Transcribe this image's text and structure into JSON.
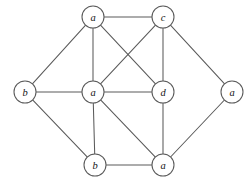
{
  "figure": {
    "kind": "undirected-graph-diagram",
    "width": 252,
    "height": 181,
    "background_color": "#ffffff",
    "stroke_color": "#5a5a5a",
    "label_color": "#141414",
    "node_radius": 11
  },
  "graph": {
    "node_count": 8,
    "edge_count": 15,
    "nodes": [
      {
        "id": "n1",
        "label": "a",
        "x": 93,
        "y": 17,
        "position": "top-left"
      },
      {
        "id": "n2",
        "label": "c",
        "x": 163,
        "y": 17,
        "position": "top-right"
      },
      {
        "id": "n3",
        "label": "b",
        "x": 25,
        "y": 92,
        "position": "middle-far-left"
      },
      {
        "id": "n4",
        "label": "a",
        "x": 93,
        "y": 92,
        "position": "middle-center"
      },
      {
        "id": "n5",
        "label": "d",
        "x": 163,
        "y": 92,
        "position": "middle-right"
      },
      {
        "id": "n6",
        "label": "a",
        "x": 232,
        "y": 92,
        "position": "middle-far-right"
      },
      {
        "id": "n7",
        "label": "b",
        "x": 95,
        "y": 165,
        "position": "bottom-left"
      },
      {
        "id": "n8",
        "label": "a",
        "x": 163,
        "y": 165,
        "position": "bottom-right"
      }
    ],
    "edges": [
      {
        "from": "n1",
        "to": "n2"
      },
      {
        "from": "n1",
        "to": "n3"
      },
      {
        "from": "n1",
        "to": "n4"
      },
      {
        "from": "n1",
        "to": "n5"
      },
      {
        "from": "n2",
        "to": "n4"
      },
      {
        "from": "n2",
        "to": "n5"
      },
      {
        "from": "n2",
        "to": "n6"
      },
      {
        "from": "n3",
        "to": "n4"
      },
      {
        "from": "n3",
        "to": "n7"
      },
      {
        "from": "n4",
        "to": "n5"
      },
      {
        "from": "n4",
        "to": "n7"
      },
      {
        "from": "n4",
        "to": "n8"
      },
      {
        "from": "n5",
        "to": "n8"
      },
      {
        "from": "n6",
        "to": "n8"
      },
      {
        "from": "n7",
        "to": "n8"
      }
    ]
  }
}
